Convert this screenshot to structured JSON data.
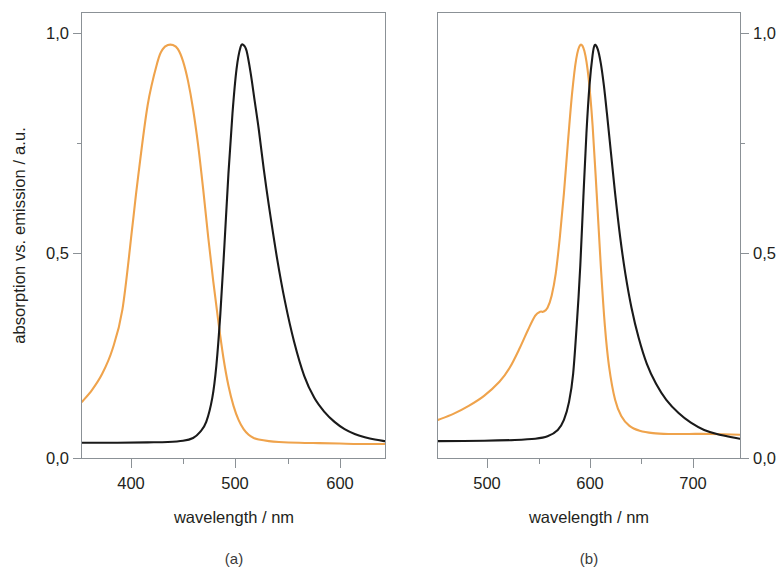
{
  "figure": {
    "ylabel": "absorption vs. emission / a.u.",
    "background": "#ffffff",
    "absorption_color": "#efa34c",
    "emission_color": "#1a1a1a",
    "frame_color": "#8b9196"
  },
  "panel_a": {
    "caption": "(a)",
    "xlabel": "wavelength / nm",
    "xticks": [
      "400",
      "500",
      "600"
    ],
    "yticks": [
      "0,0",
      "0,5",
      "1,0"
    ]
  },
  "panel_b": {
    "caption": "(b)",
    "xlabel": "wavelength / nm",
    "xticks": [
      "500",
      "600",
      "700"
    ],
    "yticks": [
      "0,0",
      "0,5",
      "1,0"
    ]
  },
  "chart_data": [
    {
      "type": "line",
      "panel": "a",
      "title": "",
      "xlabel": "wavelength / nm",
      "ylabel": "absorption vs. emission / a.u.",
      "xlim": [
        345,
        645
      ],
      "ylim": [
        -0.03,
        1.08
      ],
      "xticks": [
        400,
        500,
        600
      ],
      "xticks_minor": [
        450,
        550
      ],
      "yticks": [
        0.0,
        0.5,
        1.0
      ],
      "yticks_minor": [
        0.25,
        0.75
      ],
      "grid": false,
      "legend": "none",
      "series": [
        {
          "name": "absorption",
          "color": "#efa34c",
          "peak_x": 435,
          "peak_y": 1.0,
          "x": [
            345,
            355,
            365,
            375,
            385,
            395,
            400,
            410,
            420,
            425,
            430,
            435,
            440,
            445,
            450,
            455,
            460,
            465,
            470,
            475,
            480,
            485,
            490,
            495,
            500,
            505,
            510,
            515,
            520,
            530,
            540,
            560,
            580,
            600,
            620,
            645
          ],
          "y": [
            0.11,
            0.14,
            0.18,
            0.24,
            0.34,
            0.55,
            0.66,
            0.85,
            0.96,
            0.99,
            1.0,
            1.0,
            0.99,
            0.96,
            0.91,
            0.84,
            0.75,
            0.64,
            0.52,
            0.41,
            0.31,
            0.22,
            0.15,
            0.1,
            0.065,
            0.042,
            0.028,
            0.02,
            0.016,
            0.012,
            0.01,
            0.008,
            0.007,
            0.006,
            0.005,
            0.005
          ]
        },
        {
          "name": "emission",
          "color": "#1a1a1a",
          "peak_x": 505,
          "peak_y": 1.0,
          "x": [
            345,
            380,
            410,
            430,
            445,
            455,
            462,
            468,
            474,
            478,
            482,
            486,
            490,
            494,
            498,
            502,
            505,
            508,
            512,
            516,
            520,
            525,
            530,
            538,
            546,
            555,
            565,
            575,
            585,
            595,
            605,
            615,
            625,
            635,
            645
          ],
          "y": [
            0.008,
            0.008,
            0.009,
            0.01,
            0.013,
            0.02,
            0.035,
            0.06,
            0.12,
            0.2,
            0.33,
            0.5,
            0.68,
            0.83,
            0.94,
            0.995,
            1.0,
            0.985,
            0.93,
            0.86,
            0.79,
            0.69,
            0.6,
            0.47,
            0.36,
            0.26,
            0.175,
            0.12,
            0.085,
            0.06,
            0.042,
            0.03,
            0.022,
            0.016,
            0.012
          ]
        }
      ]
    },
    {
      "type": "line",
      "panel": "b",
      "title": "",
      "xlabel": "wavelength / nm",
      "ylabel": "absorption vs. emission / a.u.",
      "xlim": [
        455,
        750
      ],
      "ylim": [
        -0.03,
        1.08
      ],
      "xticks": [
        500,
        600,
        700
      ],
      "xticks_minor": [
        550,
        650
      ],
      "yticks": [
        0.0,
        0.5,
        1.0
      ],
      "yticks_minor": [
        0.25,
        0.75
      ],
      "grid": false,
      "legend": "none",
      "yaxis_side": "right",
      "series": [
        {
          "name": "absorption",
          "color": "#efa34c",
          "peak_x": 594,
          "peak_y": 1.0,
          "shoulder_x": 557,
          "shoulder_y": 0.33,
          "x": [
            455,
            470,
            485,
            500,
            515,
            525,
            535,
            543,
            550,
            555,
            558,
            562,
            566,
            570,
            574,
            578,
            582,
            586,
            590,
            594,
            598,
            602,
            606,
            610,
            614,
            618,
            622,
            628,
            634,
            642,
            652,
            665,
            680,
            700,
            720,
            750
          ],
          "y": [
            0.065,
            0.08,
            0.1,
            0.125,
            0.16,
            0.195,
            0.245,
            0.29,
            0.325,
            0.335,
            0.335,
            0.345,
            0.375,
            0.43,
            0.52,
            0.63,
            0.76,
            0.88,
            0.965,
            1.0,
            0.985,
            0.92,
            0.8,
            0.63,
            0.45,
            0.3,
            0.2,
            0.115,
            0.075,
            0.05,
            0.038,
            0.032,
            0.03,
            0.03,
            0.03,
            0.028
          ]
        },
        {
          "name": "emission",
          "color": "#1a1a1a",
          "peak_x": 608,
          "peak_y": 1.0,
          "x": [
            455,
            500,
            530,
            550,
            562,
            572,
            578,
            583,
            587,
            591,
            594,
            597,
            600,
            603,
            606,
            608,
            611,
            614,
            617,
            620,
            624,
            628,
            633,
            638,
            644,
            651,
            659,
            668,
            678,
            690,
            702,
            715,
            730,
            750
          ],
          "y": [
            0.012,
            0.013,
            0.015,
            0.018,
            0.024,
            0.04,
            0.065,
            0.11,
            0.18,
            0.32,
            0.45,
            0.62,
            0.78,
            0.9,
            0.975,
            1.0,
            0.99,
            0.955,
            0.9,
            0.83,
            0.73,
            0.63,
            0.52,
            0.43,
            0.345,
            0.27,
            0.205,
            0.155,
            0.115,
            0.082,
            0.058,
            0.04,
            0.028,
            0.018
          ]
        }
      ]
    }
  ]
}
